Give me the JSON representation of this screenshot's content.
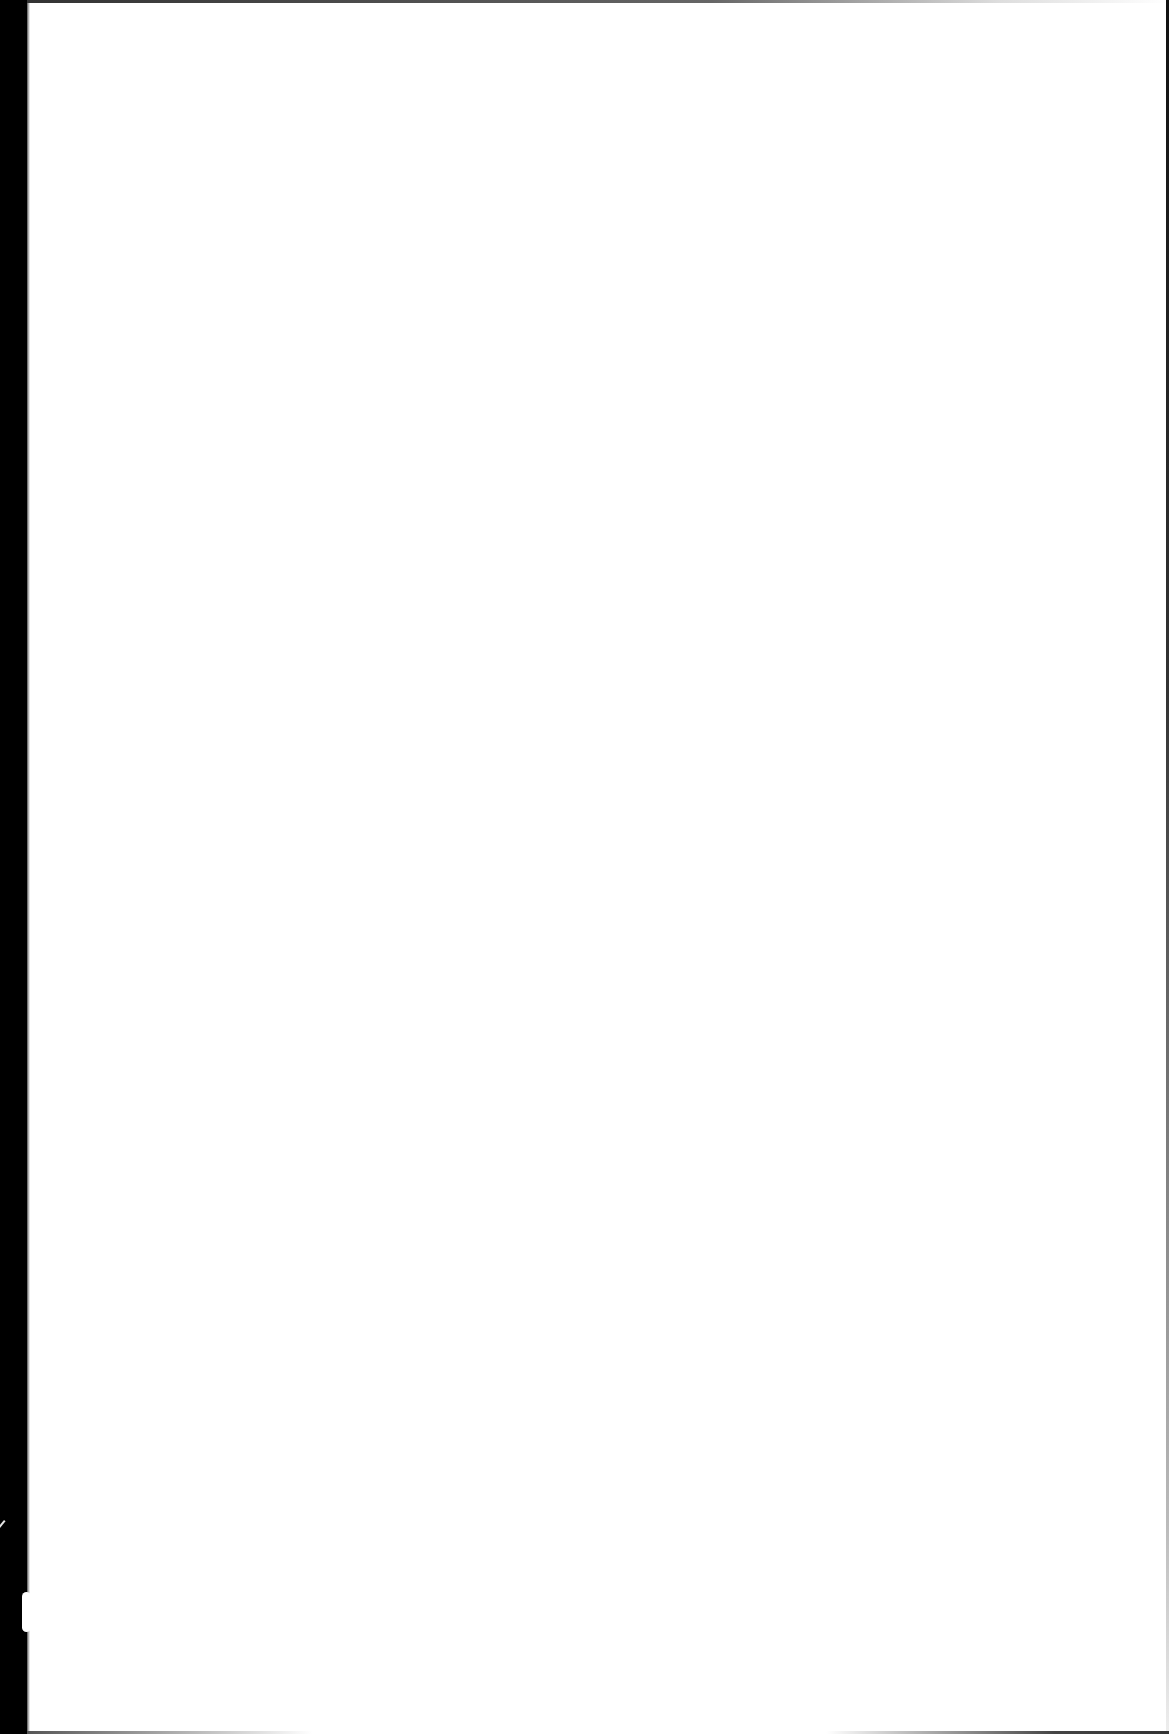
{
  "page": {
    "text": "",
    "background_color": "#ffffff",
    "scan_edge_color": "#000000"
  }
}
